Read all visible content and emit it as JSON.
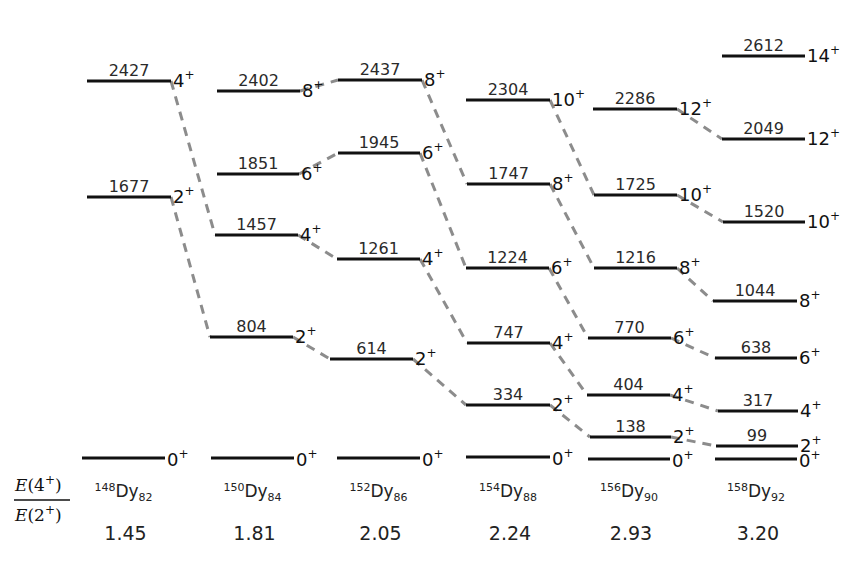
{
  "ratio_label": {
    "numerator": "E(4+)",
    "denominator": "E(2+)"
  },
  "colors": {
    "level": "#111111",
    "transition": "#8c8c8c",
    "text": "#2a2a2a"
  },
  "chart_data": {
    "type": "level-scheme",
    "units": "keV",
    "columns": [
      {
        "nucleus": {
          "A": "148",
          "symbol": "Dy",
          "N": "82"
        },
        "ratio": "1.45",
        "levels": [
          {
            "energy": "2427",
            "spin": "4",
            "y": 81,
            "x1": 87,
            "x2": 171
          },
          {
            "energy": "1677",
            "spin": "2",
            "y": 197,
            "x1": 87,
            "x2": 171
          },
          {
            "energy": "",
            "spin": "0",
            "y": 458,
            "x1": 82,
            "x2": 165
          }
        ]
      },
      {
        "nucleus": {
          "A": "150",
          "symbol": "Dy",
          "N": "84"
        },
        "ratio": "1.81",
        "levels": [
          {
            "energy": "2402",
            "spin": "8",
            "y": 91,
            "x1": 217,
            "x2": 300
          },
          {
            "energy": "1851",
            "spin": "6",
            "y": 174,
            "x1": 217,
            "x2": 299
          },
          {
            "energy": "1457",
            "spin": "4",
            "y": 235,
            "x1": 215,
            "x2": 298
          },
          {
            "energy": "804",
            "spin": "2",
            "y": 337,
            "x1": 210,
            "x2": 293
          },
          {
            "energy": "",
            "spin": "0",
            "y": 458,
            "x1": 211,
            "x2": 294
          }
        ]
      },
      {
        "nucleus": {
          "A": "152",
          "symbol": "Dy",
          "N": "86"
        },
        "ratio": "2.05",
        "levels": [
          {
            "energy": "2437",
            "spin": "8",
            "y": 80,
            "x1": 338,
            "x2": 422
          },
          {
            "energy": "1945",
            "spin": "6",
            "y": 153,
            "x1": 338,
            "x2": 420
          },
          {
            "energy": "1261",
            "spin": "4",
            "y": 259,
            "x1": 337,
            "x2": 420
          },
          {
            "energy": "614",
            "spin": "2",
            "y": 359,
            "x1": 330,
            "x2": 413
          },
          {
            "energy": "",
            "spin": "0",
            "y": 458,
            "x1": 337,
            "x2": 420
          }
        ]
      },
      {
        "nucleus": {
          "A": "154",
          "symbol": "Dy",
          "N": "88"
        },
        "ratio": "2.24",
        "levels": [
          {
            "energy": "2304",
            "spin": "10",
            "y": 100,
            "x1": 466,
            "x2": 550
          },
          {
            "energy": "1747",
            "spin": "8",
            "y": 184,
            "x1": 467,
            "x2": 550
          },
          {
            "energy": "1224",
            "spin": "6",
            "y": 268,
            "x1": 466,
            "x2": 549
          },
          {
            "energy": "747",
            "spin": "4",
            "y": 343,
            "x1": 467,
            "x2": 550
          },
          {
            "energy": "334",
            "spin": "2",
            "y": 405,
            "x1": 466,
            "x2": 550
          },
          {
            "energy": "",
            "spin": "0",
            "y": 457,
            "x1": 466,
            "x2": 550
          }
        ]
      },
      {
        "nucleus": {
          "A": "156",
          "symbol": "Dy",
          "N": "90"
        },
        "ratio": "2.93",
        "levels": [
          {
            "energy": "2286",
            "spin": "12",
            "y": 109,
            "x1": 593,
            "x2": 677
          },
          {
            "energy": "1725",
            "spin": "10",
            "y": 195,
            "x1": 594,
            "x2": 677
          },
          {
            "energy": "1216",
            "spin": "8",
            "y": 268,
            "x1": 594,
            "x2": 677
          },
          {
            "energy": "770",
            "spin": "6",
            "y": 338,
            "x1": 588,
            "x2": 671
          },
          {
            "energy": "404",
            "spin": "4",
            "y": 395,
            "x1": 587,
            "x2": 670
          },
          {
            "energy": "138",
            "spin": "2",
            "y": 437,
            "x1": 590,
            "x2": 671
          },
          {
            "energy": "",
            "spin": "0",
            "y": 459,
            "x1": 588,
            "x2": 670
          }
        ]
      },
      {
        "nucleus": {
          "A": "158",
          "symbol": "Dy",
          "N": "92"
        },
        "ratio": "3.20",
        "levels": [
          {
            "energy": "2612",
            "spin": "14",
            "y": 56,
            "x1": 722,
            "x2": 805
          },
          {
            "energy": "2049",
            "spin": "12",
            "y": 139,
            "x1": 722,
            "x2": 805
          },
          {
            "energy": "1520",
            "spin": "10",
            "y": 222,
            "x1": 723,
            "x2": 805
          },
          {
            "energy": "1044",
            "spin": "8",
            "y": 301,
            "x1": 713,
            "x2": 797
          },
          {
            "energy": "638",
            "spin": "6",
            "y": 358,
            "x1": 715,
            "x2": 797
          },
          {
            "energy": "317",
            "spin": "4",
            "y": 411,
            "x1": 718,
            "x2": 798
          },
          {
            "energy": "99",
            "spin": "2",
            "y": 446,
            "x1": 716,
            "x2": 798
          },
          {
            "energy": "",
            "spin": "0",
            "y": 459,
            "x1": 715,
            "x2": 797
          }
        ]
      }
    ],
    "connections": [
      {
        "from": [
          0,
          0
        ],
        "to": [
          1,
          2
        ]
      },
      {
        "from": [
          0,
          1
        ],
        "to": [
          1,
          3
        ]
      },
      {
        "from": [
          1,
          0
        ],
        "to": [
          2,
          0
        ]
      },
      {
        "from": [
          1,
          1
        ],
        "to": [
          2,
          1
        ]
      },
      {
        "from": [
          1,
          2
        ],
        "to": [
          2,
          2
        ]
      },
      {
        "from": [
          1,
          3
        ],
        "to": [
          2,
          3
        ]
      },
      {
        "from": [
          2,
          0
        ],
        "to": [
          3,
          1
        ]
      },
      {
        "from": [
          2,
          1
        ],
        "to": [
          3,
          2
        ]
      },
      {
        "from": [
          2,
          2
        ],
        "to": [
          3,
          3
        ]
      },
      {
        "from": [
          2,
          3
        ],
        "to": [
          3,
          4
        ]
      },
      {
        "from": [
          3,
          0
        ],
        "to": [
          4,
          1
        ]
      },
      {
        "from": [
          3,
          1
        ],
        "to": [
          4,
          2
        ]
      },
      {
        "from": [
          3,
          2
        ],
        "to": [
          4,
          3
        ]
      },
      {
        "from": [
          3,
          3
        ],
        "to": [
          4,
          4
        ]
      },
      {
        "from": [
          3,
          4
        ],
        "to": [
          4,
          5
        ]
      },
      {
        "from": [
          4,
          0
        ],
        "to": [
          5,
          1
        ]
      },
      {
        "from": [
          4,
          1
        ],
        "to": [
          5,
          2
        ]
      },
      {
        "from": [
          4,
          2
        ],
        "to": [
          5,
          3
        ]
      },
      {
        "from": [
          4,
          3
        ],
        "to": [
          5,
          4
        ]
      },
      {
        "from": [
          4,
          4
        ],
        "to": [
          5,
          5
        ]
      },
      {
        "from": [
          4,
          5
        ],
        "to": [
          5,
          6
        ]
      }
    ]
  }
}
